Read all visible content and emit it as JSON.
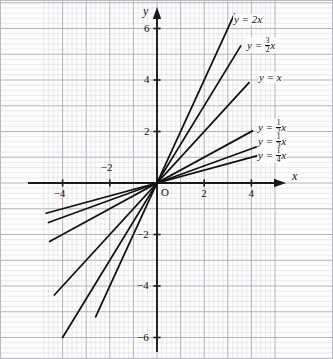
{
  "chart_data": {
    "type": "line",
    "title": "",
    "xlabel": "x",
    "ylabel": "y",
    "xlim": [
      -4.9,
      5.1
    ],
    "ylim": [
      -7.1,
      7.0
    ],
    "grid": true,
    "grid_minor_step": 0.2,
    "grid_major_step": 1,
    "legend": "inline-labels",
    "origin_label": "O",
    "x_ticks": [
      -4,
      -2,
      2,
      4
    ],
    "x_tick_labels": [
      "-4",
      "-2",
      "2",
      "4"
    ],
    "y_ticks": [
      -6,
      -4,
      -2,
      2,
      4,
      6
    ],
    "y_tick_labels": [
      "-6",
      "-4",
      "-2",
      "2",
      "4",
      "6"
    ],
    "series": [
      {
        "name": "y = 2x",
        "slope": 2,
        "label_parts": {
          "lhs": "y",
          "eq": "=",
          "coef_int": "2",
          "coef_num": "",
          "coef_den": "",
          "var": "x"
        },
        "x_start": -2.6,
        "x_end": 3.28
      },
      {
        "name": "y = 3/2 x",
        "slope": 1.5,
        "label_parts": {
          "lhs": "y",
          "eq": "=",
          "coef_int": "",
          "coef_num": "3",
          "coef_den": "2",
          "var": "x"
        },
        "x_start": -4.0,
        "x_end": 3.55
      },
      {
        "name": "y = x",
        "slope": 1,
        "label_parts": {
          "lhs": "y",
          "eq": "=",
          "coef_int": "",
          "coef_num": "",
          "coef_den": "",
          "var": "x"
        },
        "x_start": -4.35,
        "x_end": 3.9
      },
      {
        "name": "y = 1/2 x",
        "slope": 0.5,
        "label_parts": {
          "lhs": "y",
          "eq": "=",
          "coef_int": "",
          "coef_num": "1",
          "coef_den": "2",
          "var": "x"
        },
        "x_start": -4.55,
        "x_end": 4.05
      },
      {
        "name": "y = 1/3 x",
        "slope": 0.3333,
        "label_parts": {
          "lhs": "y",
          "eq": "=",
          "coef_int": "",
          "coef_num": "1",
          "coef_den": "3",
          "var": "x"
        },
        "x_start": -4.6,
        "x_end": 4.2
      },
      {
        "name": "y = 1/4 x",
        "slope": 0.25,
        "label_parts": {
          "lhs": "y",
          "eq": "=",
          "coef_int": "",
          "coef_num": "1",
          "coef_den": "4",
          "var": "x"
        },
        "x_start": -4.7,
        "x_end": 4.3
      }
    ],
    "colors": {
      "line": "#111111",
      "axis": "#1a1a1a",
      "grid_minor": "#d8d8de",
      "grid_major": "#a9a9b4",
      "background": "#fdfdfd",
      "border": "#b9b9c2"
    }
  },
  "labels": {
    "x_axis": "x",
    "y_axis": "y",
    "origin": "O"
  }
}
